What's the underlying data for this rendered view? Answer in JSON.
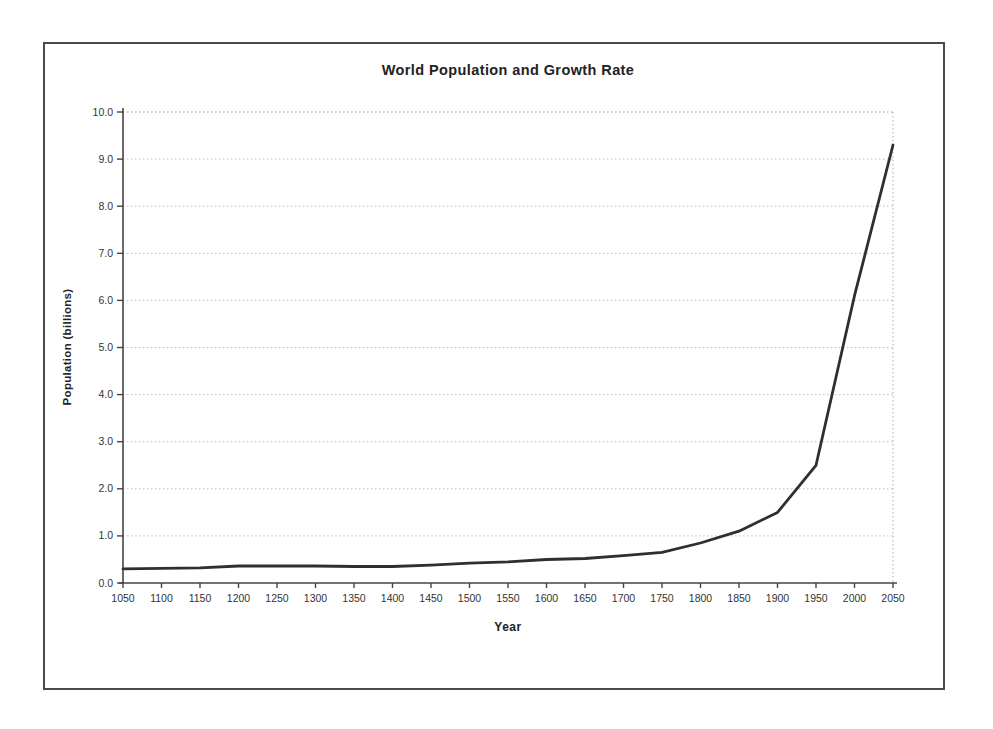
{
  "chart_data": {
    "type": "line",
    "title": "World Population and Growth Rate",
    "xlabel": "Year",
    "ylabel": "Population (billions)",
    "xlim": [
      1050,
      2050
    ],
    "ylim": [
      0,
      10
    ],
    "xticks": [
      1050,
      1100,
      1150,
      1200,
      1250,
      1300,
      1350,
      1400,
      1450,
      1500,
      1550,
      1600,
      1650,
      1700,
      1750,
      1800,
      1850,
      1900,
      1950,
      2000,
      2050
    ],
    "ytick_labels": [
      "0.0",
      "1.0",
      "2.0",
      "3.0",
      "4.0",
      "5.0",
      "6.0",
      "7.0",
      "8.0",
      "9.0",
      "10.0"
    ],
    "grid": "horizontal-dotted",
    "legend": "none",
    "series": [
      {
        "name": "World population",
        "x": [
          1050,
          1100,
          1150,
          1200,
          1250,
          1300,
          1350,
          1400,
          1450,
          1500,
          1550,
          1600,
          1650,
          1700,
          1750,
          1800,
          1850,
          1900,
          1950,
          2000,
          2050
        ],
        "values": [
          0.3,
          0.31,
          0.32,
          0.36,
          0.36,
          0.36,
          0.35,
          0.35,
          0.38,
          0.42,
          0.45,
          0.5,
          0.52,
          0.58,
          0.65,
          0.85,
          1.1,
          1.5,
          2.5,
          6.1,
          9.3
        ]
      }
    ],
    "colors": {
      "line": "#2f2f2f",
      "grid": "#bdbdbd",
      "top_grid": "#9a9a9a",
      "right_border": "#aaaaaa",
      "axis": "#444444",
      "text": "#333333",
      "frame": "#4a4a4a",
      "background": "#ffffff"
    }
  }
}
